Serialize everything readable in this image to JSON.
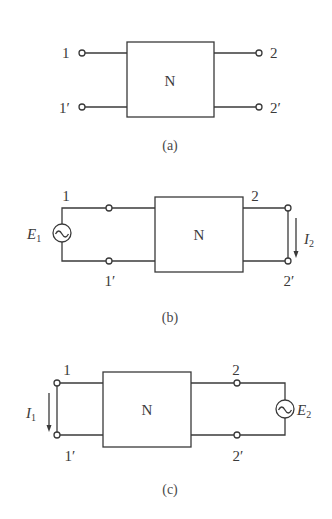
{
  "figures": [
    {
      "id": "a",
      "caption": "(a)",
      "network_label": "N",
      "terminals": {
        "t1": "1",
        "t1p": "1′",
        "t2": "2",
        "t2p": "2′"
      }
    },
    {
      "id": "b",
      "caption": "(b)",
      "network_label": "N",
      "terminals": {
        "t1": "1",
        "t1p": "1′",
        "t2": "2",
        "t2p": "2′"
      },
      "source": {
        "symbol": "E",
        "subscript": "1",
        "type": "ac-voltage-source",
        "port": "1-1′"
      },
      "current": {
        "symbol": "I",
        "subscript": "2",
        "direction": "down",
        "port": "2-2′ (short circuit)"
      }
    },
    {
      "id": "c",
      "caption": "(c)",
      "network_label": "N",
      "terminals": {
        "t1": "1",
        "t1p": "1′",
        "t2": "2",
        "t2p": "2′"
      },
      "source": {
        "symbol": "E",
        "subscript": "2",
        "type": "ac-voltage-source",
        "port": "2-2′"
      },
      "current": {
        "symbol": "I",
        "subscript": "1",
        "direction": "down",
        "port": "1-1′ (short circuit)"
      }
    }
  ]
}
